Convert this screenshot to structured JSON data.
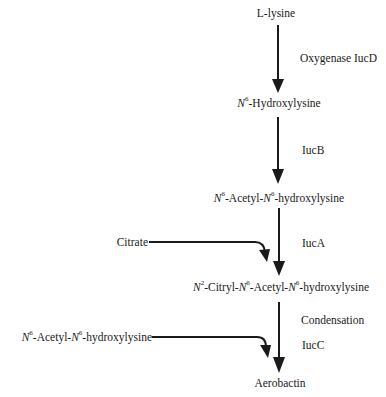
{
  "diagram": {
    "type": "biosynthetic-pathway",
    "compounds": {
      "lysine": {
        "prefix": "L",
        "name": "-lysine"
      },
      "hydroxylysine": {
        "n": "N",
        "sup": "6",
        "name": "-Hydroxylysine"
      },
      "acetyl_hydroxylysine": {
        "n1": "N",
        "sup1": "6",
        "mid": "-Acetyl-",
        "n2": "N",
        "sup2": "6",
        "name": "-hydroxylysine"
      },
      "citryl": {
        "n1": "N",
        "sup1": "2",
        "mid1": "-Citryl-",
        "n2": "N",
        "sup2": "6",
        "mid2": "-Acetyl-",
        "n3": "N",
        "sup3": "6",
        "name": "-hydroxylysine"
      },
      "aerobactin": {
        "name": "Aerobactin"
      }
    },
    "inputs": {
      "citrate": "Citrate",
      "acetyl_hydroxylysine": {
        "n1": "N",
        "sup1": "6",
        "mid": "-Acetyl-",
        "n2": "N",
        "sup2": "6",
        "name": "-hydroxylysine"
      }
    },
    "enzymes": {
      "step1": "Oxygenase IucD",
      "step2": "IucB",
      "step3": "IucA",
      "step4a": "Condensation",
      "step4b": "IucC"
    },
    "steps": [
      {
        "from": "L-lysine",
        "to": "N6-Hydroxylysine",
        "enzyme": "Oxygenase IucD"
      },
      {
        "from": "N6-Hydroxylysine",
        "to": "N6-Acetyl-N6-hydroxylysine",
        "enzyme": "IucB"
      },
      {
        "from": "N6-Acetyl-N6-hydroxylysine",
        "to": "N2-Citryl-N6-Acetyl-N6-hydroxylysine",
        "enzyme": "IucA",
        "cosubstrate": "Citrate"
      },
      {
        "from": "N2-Citryl-N6-Acetyl-N6-hydroxylysine",
        "to": "Aerobactin",
        "enzyme": "Condensation IucC",
        "cosubstrate": "N6-Acetyl-N6-hydroxylysine"
      }
    ],
    "colors": {
      "ink": "#1a1a1a",
      "background": "#ffffff"
    }
  }
}
